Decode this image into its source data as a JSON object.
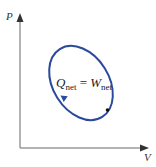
{
  "diagram": {
    "type": "PV cycle diagram",
    "axes": {
      "y_label": "P",
      "x_label": "V"
    },
    "equation": {
      "lhs_symbol": "Q",
      "lhs_subscript": "net",
      "operator": "=",
      "rhs_symbol": "W",
      "rhs_subscript": "net"
    },
    "cycle": {
      "shape": "ellipse",
      "direction": "counterclockwise",
      "color": "#2b4a9c"
    },
    "colors": {
      "axis": "#9a9a9a",
      "cycle": "#2b4a9c",
      "text": "#222222"
    }
  }
}
